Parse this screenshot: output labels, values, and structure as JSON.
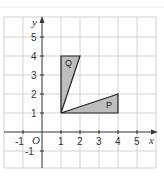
{
  "diagram": {
    "type": "coordinate-grid",
    "axes": {
      "x_label": "x",
      "y_label": "y",
      "origin_label": "O"
    },
    "x_ticks": [
      "-1",
      "1",
      "2",
      "3",
      "4",
      "5"
    ],
    "y_ticks": [
      "-1",
      "1",
      "2",
      "3",
      "4",
      "5"
    ],
    "shapes": [
      {
        "name": "Q",
        "label": "Q",
        "vertices": [
          [
            1,
            1
          ],
          [
            1,
            4
          ],
          [
            2,
            4
          ]
        ],
        "fill": "#bdbdbd"
      },
      {
        "name": "P",
        "label": "P",
        "vertices": [
          [
            1,
            1
          ],
          [
            4,
            1
          ],
          [
            4,
            2
          ]
        ],
        "fill": "#bdbdbd"
      }
    ],
    "colors": {
      "grid": "#c8c8c8",
      "axis": "#333333",
      "shape_stroke": "#222222"
    }
  }
}
